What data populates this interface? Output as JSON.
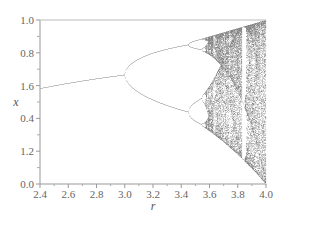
{
  "chart_data": {
    "type": "scatter",
    "title": "",
    "xlabel": "r",
    "ylabel": "x",
    "xlim": [
      2.4,
      4.0
    ],
    "ylim": [
      0.0,
      1.0
    ],
    "xticks": [
      "2.4",
      "2.6",
      "2.8",
      "3.0",
      "3.2",
      "3.4",
      "3.6",
      "3.8",
      "4.0"
    ],
    "yticks": [
      "1.0",
      "0.8",
      "1.6",
      "0.4",
      "1.2",
      "0.0"
    ],
    "grid": false,
    "series": [
      {
        "name": "attractor",
        "r_start": 2.4,
        "r_end": 4.0,
        "x_at_2.4": 0.583,
        "bifurcation_r": [
          3.0,
          3.449,
          3.544
        ],
        "chaos_onset_r": 3.57
      }
    ]
  }
}
